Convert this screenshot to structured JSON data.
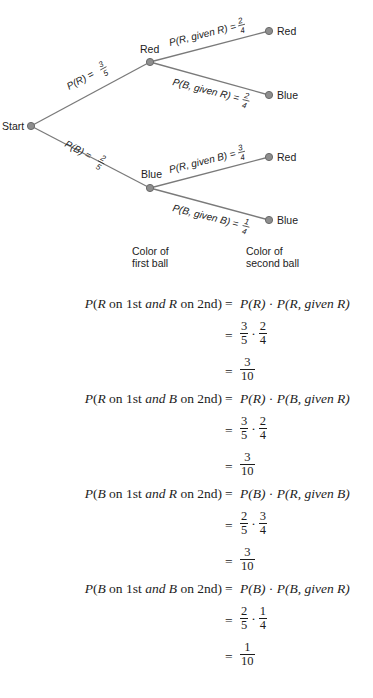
{
  "tree": {
    "colors": {
      "line": "#7a7a7a",
      "node_fill": "#8e8e8e",
      "node_stroke": "#6a6a6a",
      "text": "#222222"
    },
    "start_label": "Start",
    "first_level": [
      {
        "label": "Red",
        "edge_prefix": "P(R) =",
        "edge_num": "3",
        "edge_den": "5"
      },
      {
        "label": "Blue",
        "edge_prefix": "P(B) =",
        "edge_num": "2",
        "edge_den": "5"
      }
    ],
    "second_level": [
      {
        "parent": "Red",
        "label": "Red",
        "edge_prefix": "P(R, given R) =",
        "edge_num": "2",
        "edge_den": "4"
      },
      {
        "parent": "Red",
        "label": "Blue",
        "edge_prefix": "P(B, given R) =",
        "edge_num": "2",
        "edge_den": "4"
      },
      {
        "parent": "Blue",
        "label": "Red",
        "edge_prefix": "P(R, given B) =",
        "edge_num": "3",
        "edge_den": "4"
      },
      {
        "parent": "Blue",
        "label": "Blue",
        "edge_prefix": "P(B, given B) =",
        "edge_num": "1",
        "edge_den": "4"
      }
    ],
    "captions": {
      "first_line1": "Color of",
      "first_line2": "first ball",
      "second_line1": "Color of",
      "second_line2": "second ball"
    }
  },
  "equations": [
    {
      "lhs_p": "P",
      "lhs_a": "R",
      "lhs_on1": " on 1st ",
      "lhs_and": "and",
      "lhs_b": "R",
      "lhs_on2": " on 2nd)",
      "rhs_text": "P(R) · P(R, given R)",
      "rhs_p1": "P(R)",
      "rhs_p2": "P(R, ",
      "rhs_given": "given",
      "rhs_end": " R)",
      "step_num1": "3",
      "step_den1": "5",
      "step_num2": "2",
      "step_den2": "4",
      "result_num": "3",
      "result_den": "10"
    },
    {
      "lhs_p": "P",
      "lhs_a": "R",
      "lhs_on1": " on 1st ",
      "lhs_and": "and",
      "lhs_b": "B",
      "lhs_on2": " on 2nd)",
      "rhs_p1": "P(R)",
      "rhs_p2": "P(B, ",
      "rhs_given": "given",
      "rhs_end": " R)",
      "step_num1": "3",
      "step_den1": "5",
      "step_num2": "2",
      "step_den2": "4",
      "result_num": "3",
      "result_den": "10"
    },
    {
      "lhs_p": "P",
      "lhs_a": "B",
      "lhs_on1": " on 1st ",
      "lhs_and": "and",
      "lhs_b": "R",
      "lhs_on2": " on 2nd)",
      "rhs_p1": "P(B)",
      "rhs_p2": "P(R, ",
      "rhs_given": "given",
      "rhs_end": " B)",
      "step_num1": "2",
      "step_den1": "5",
      "step_num2": "3",
      "step_den2": "4",
      "result_num": "3",
      "result_den": "10"
    },
    {
      "lhs_p": "P",
      "lhs_a": "B",
      "lhs_on1": " on 1st ",
      "lhs_and": "and",
      "lhs_b": "B",
      "lhs_on2": " on 2nd)",
      "rhs_p1": "P(B)",
      "rhs_p2": "P(B, ",
      "rhs_given": "given",
      "rhs_end": " R)",
      "step_num1": "2",
      "step_den1": "5",
      "step_num2": "1",
      "step_den2": "4",
      "result_num": "1",
      "result_den": "10"
    }
  ],
  "symbols": {
    "equals": "=",
    "dot": "·"
  }
}
